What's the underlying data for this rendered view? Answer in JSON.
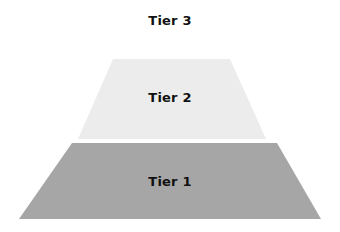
{
  "diagram": {
    "type": "pyramid",
    "tiers": [
      {
        "label": "Tier 3",
        "color": "#ffffff"
      },
      {
        "label": "Tier 2",
        "color": "#ececec"
      },
      {
        "label": "Tier 1",
        "color": "#a6a6a6"
      }
    ]
  }
}
